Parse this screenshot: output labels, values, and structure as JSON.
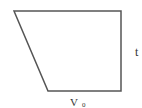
{
  "diagram": {
    "shape": "trapezoid",
    "stroke_color": "#555555",
    "vertices": {
      "top_left": [
        14,
        11
      ],
      "top_right": [
        121,
        11
      ],
      "bottom_right": [
        121,
        91
      ],
      "bottom_left": [
        48,
        91
      ]
    },
    "labels": {
      "right_side": "t",
      "bottom_side_main": "V",
      "bottom_side_sub": "0"
    }
  }
}
